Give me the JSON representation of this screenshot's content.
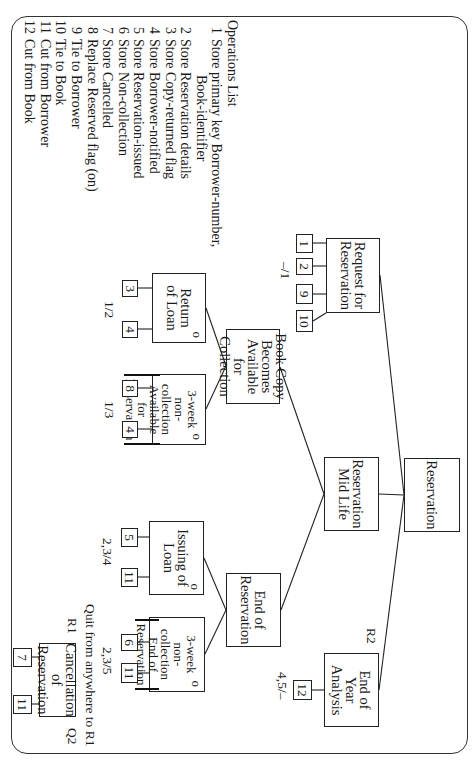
{
  "diagram": {
    "type": "Jackson structure diagram (rotated 90°)",
    "root": {
      "label": "Reservation"
    },
    "level1": {
      "request": {
        "label": "Request for\nReservation",
        "ops": [
          "1",
          "2",
          "9",
          "10"
        ],
        "state_label": "–/1"
      },
      "mid_life": {
        "label": "Reservation\nMid Life",
        "iteration": ""
      },
      "end_of_year": {
        "label": "End of\nYear Analysis",
        "ops": [
          "12"
        ],
        "state_label": "4,5/–",
        "marker": "R2"
      }
    },
    "mid_life_children": {
      "available": {
        "label": "Book Copy\nBecomes\nAvailable for\nCollection"
      },
      "end_res": {
        "label": "End of\nReservation"
      }
    },
    "available_children": {
      "return_of_loan": {
        "label": "Return\nof Loan",
        "selection": "o",
        "ops": [
          "3",
          "4"
        ],
        "state_label": "1/2"
      },
      "non_collection_available": {
        "line1": "3-week",
        "line2": "non-collection",
        "bracket1": "Available for",
        "bracket2": "Reservation",
        "selection": "o",
        "ops": [
          "8",
          "4"
        ],
        "state_label": "1/3"
      }
    },
    "end_res_children": {
      "issuing_of_loan": {
        "label": "Issuing of\nLoan",
        "selection": "o",
        "ops": [
          "5",
          "11"
        ],
        "state_label": "2,3/4"
      },
      "non_collection_end": {
        "line1": "3-week",
        "line2": "non-collection",
        "bracket1": "End of",
        "bracket2": "Reservation",
        "selection": "o",
        "ops": [
          "6",
          "11"
        ],
        "state_label": "2,3/5"
      }
    },
    "cancellation": {
      "label": "Cancellation\nof Reservation",
      "ops": [
        "7",
        "11"
      ],
      "quit_note": "Quit from anywhere to R1",
      "marker_r1": "R1",
      "marker_q2": "Q2"
    }
  },
  "operations_list": {
    "title": "Operations List",
    "items": [
      {
        "num": "1",
        "text": "Store primary key Borrower-number,",
        "cont": "Book-identifier"
      },
      {
        "num": "2",
        "text": "Store Reservation details"
      },
      {
        "num": "3",
        "text": "Store Copy-returned flag"
      },
      {
        "num": "4",
        "text": "Store Borrower-notified"
      },
      {
        "num": "5",
        "text": "Store Reservation-issued"
      },
      {
        "num": "6",
        "text": "Store Non-collection"
      },
      {
        "num": "7",
        "text": "Store Cancelled"
      },
      {
        "num": "8",
        "text": "Replace Reserved flag (on)"
      },
      {
        "num": "9",
        "text": "Tie to Borrower"
      },
      {
        "num": "10",
        "text": "Tie to Book"
      },
      {
        "num": "11",
        "text": "Cut from Borrower"
      },
      {
        "num": "12",
        "text": "Cut from Book"
      }
    ]
  }
}
